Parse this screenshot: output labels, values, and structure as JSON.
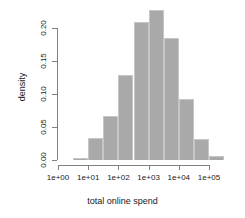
{
  "chart_data": {
    "type": "bar",
    "title": "",
    "subtitle": "",
    "xlabel": "total online spend",
    "ylabel": "density",
    "grid": false,
    "legend": null,
    "x_scale": "log10",
    "xtick_labels": [
      "1e+00",
      "1e+01",
      "1e+02",
      "1e+03",
      "1e+04",
      "1e+05"
    ],
    "xtick_values": [
      0,
      1,
      2,
      3,
      4,
      5
    ],
    "xlim": [
      0,
      5
    ],
    "ytick_labels": [
      "0.00",
      "0.05",
      "0.10",
      "0.15",
      "0.20"
    ],
    "ytick_values": [
      0.0,
      0.05,
      0.1,
      0.15,
      0.2
    ],
    "ylim": [
      0,
      0.232
    ],
    "bar_color": "#a9a9a9",
    "bar_border_color": "#c6c6c6",
    "axis_color": "#808080",
    "background": "#ffffff",
    "bin_width_log10": 0.5,
    "categories": [
      "0.0-0.5",
      "0.5-1.0",
      "1.0-1.5",
      "1.5-2.0",
      "2.0-2.5",
      "2.5-3.0",
      "3.0-3.5",
      "3.5-4.0",
      "4.0-4.5",
      "4.5-5.0"
    ],
    "bins": [
      {
        "left": 0.5,
        "right": 1.0,
        "value": 0.003
      },
      {
        "left": 1.0,
        "right": 1.5,
        "value": 0.034
      },
      {
        "left": 1.5,
        "right": 2.0,
        "value": 0.066
      },
      {
        "left": 2.0,
        "right": 2.5,
        "value": 0.129
      },
      {
        "left": 2.5,
        "right": 3.0,
        "value": 0.209
      },
      {
        "left": 3.0,
        "right": 3.5,
        "value": 0.228
      },
      {
        "left": 3.5,
        "right": 4.0,
        "value": 0.185
      },
      {
        "left": 4.0,
        "right": 4.5,
        "value": 0.092
      },
      {
        "left": 4.5,
        "right": 5.0,
        "value": 0.032
      },
      {
        "left": 5.0,
        "right": 5.5,
        "value": 0.006
      }
    ],
    "values": [
      0.003,
      0.034,
      0.066,
      0.129,
      0.209,
      0.228,
      0.185,
      0.092,
      0.032,
      0.006
    ]
  }
}
